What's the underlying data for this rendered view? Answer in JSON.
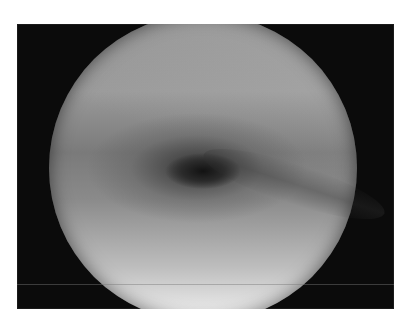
{
  "image": {
    "subject": "endoscopic view, circular field on black background",
    "frame_color": "#0b0b0b",
    "page_background": "#ffffff"
  },
  "right_margin_fragments": [
    "",
    "",
    "",
    "",
    ""
  ]
}
